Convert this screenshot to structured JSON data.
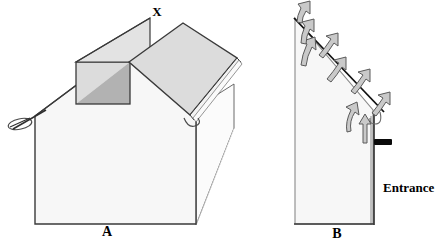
{
  "figure": {
    "title_visible": false,
    "background_color": "#ffffff",
    "panels": [
      {
        "id": "panel-a",
        "label": "A",
        "label_position": {
          "x": 107,
          "y": 231
        },
        "callouts": [
          {
            "id": "callout-x",
            "text": "X",
            "x": 157,
            "y": 16
          }
        ],
        "description_visible_text": [
          "X",
          "A"
        ]
      },
      {
        "id": "panel-b",
        "label": "B",
        "label_position": {
          "x": 337,
          "y": 234
        },
        "callouts": [
          {
            "id": "callout-entrance",
            "text": "Entrance",
            "x": 383,
            "y": 190
          }
        ],
        "description_visible_text": [
          "Entrance",
          "B"
        ],
        "airflow_arrow_count": 8
      }
    ],
    "colors": {
      "outline": "#3a3a3a",
      "wall_face": "#f7f7f7",
      "wall_side": "#fbfbfb",
      "roof_light": "#e3e3e3",
      "roof_panel": "#dcdcdc",
      "valley_dark": "#b2b2b2",
      "arrow_fill": "#c9c9c9",
      "arrow_outline": "#5a5a5a",
      "entrance_bar": "#0a0a0a",
      "text": "#000000"
    },
    "labels": {
      "x": "X",
      "a": "A",
      "b": "B",
      "entrance": "Entrance"
    }
  }
}
